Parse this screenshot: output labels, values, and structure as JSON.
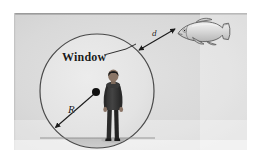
{
  "figure": {
    "caption_present": false,
    "panel": {
      "background_color": "#d9d9d9",
      "border_color": "#9a9a9a",
      "x": 14,
      "y": 13,
      "width": 233,
      "height": 137
    },
    "page_background": "#ffffff"
  },
  "labels": {
    "window": "Window",
    "radius": "R",
    "distance": "d"
  },
  "objects": {
    "circle": {
      "name": "window-circle",
      "center_x": 97,
      "center_y": 91,
      "radius": 57,
      "stroke_color": "#4a4a4a",
      "fill_color": "#e4e4e4"
    },
    "center_dot": {
      "name": "circle-center-dot",
      "x": 96,
      "y": 92,
      "radius": 4,
      "color": "#111111"
    },
    "person": {
      "name": "standing-person",
      "description": "person standing, viewed from behind",
      "body_color": "#3b3b3b",
      "skin_color": "#7a6a5f",
      "x": 110,
      "y": 73,
      "height": 73
    },
    "fish": {
      "name": "fish",
      "description": "fish facing left, outside the window",
      "body_color": "#d5d5d5",
      "outline_color": "#555555",
      "x": 178,
      "y": 22,
      "width": 52,
      "height": 24
    },
    "ground": {
      "name": "ground-line",
      "y": 138,
      "color": "#8d8d8d",
      "shade_color": "#c7c7c7"
    }
  },
  "annotations": {
    "radius_arrow": {
      "name": "radius-arrow",
      "from_x": 96,
      "from_y": 92,
      "to_x": 54,
      "to_y": 129,
      "label": "R",
      "double_headed": false
    },
    "distance_arrow": {
      "name": "distance-arrow",
      "from_x": 140,
      "from_y": 49,
      "to_x": 178,
      "to_y": 27,
      "label": "d",
      "double_headed": true
    },
    "window_leader": {
      "name": "window-leader-line",
      "from_x": 103,
      "from_y": 57,
      "to_x": 133,
      "to_y": 47
    }
  },
  "colors": {
    "panel_fill": "#d9d9d9",
    "circle_fill": "#e4e4e4",
    "stroke_dark": "#333333",
    "text": "#1a1a1a"
  }
}
